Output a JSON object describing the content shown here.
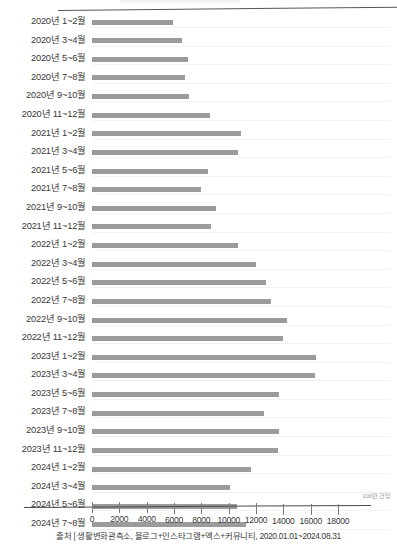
{
  "chart_data": {
    "type": "bar",
    "orientation": "horizontal",
    "title": "",
    "xlabel": "",
    "ylabel": "",
    "unit_label": "100만 건당",
    "xlim": [
      0,
      18000
    ],
    "grid": true,
    "legend": null,
    "bar_color": "#9b9b9b",
    "axis_ticks": [
      0,
      2000,
      4000,
      6000,
      8000,
      10000,
      12000,
      14000,
      16000,
      18000
    ],
    "tick_labels": [
      "0",
      "2000",
      "4000",
      "6000",
      "8000",
      "10000",
      "12000",
      "14000",
      "16000",
      "18000"
    ],
    "categories": [
      "2020년 1~2월",
      "2020년 3~4월",
      "2020년 5~6월",
      "2020년 7~8월",
      "2020년 9~10월",
      "2020년 11~12월",
      "2021년 1~2월",
      "2021년 3~4월",
      "2021년 5~6월",
      "2021년 7~8월",
      "2021년 9~10월",
      "2021년 11~12월",
      "2022년 1~2월",
      "2022년 3~4월",
      "2022년 5~6월",
      "2022년 7~8월",
      "2022년 9~10월",
      "2022년 11~12월",
      "2023년 1~2월",
      "2023년 3~4월",
      "2023년 5~6월",
      "2023년 7~8월",
      "2023년 9~10월",
      "2023년 11~12월",
      "2024년 1~2월",
      "2024년 3~4월",
      "2024년 5~6월",
      "2024년 7~8월"
    ],
    "values": [
      5900,
      6600,
      7000,
      6800,
      7100,
      8600,
      10900,
      10700,
      8500,
      8000,
      9100,
      8700,
      10700,
      12000,
      12700,
      13100,
      14300,
      14000,
      16400,
      16300,
      13700,
      12600,
      13700,
      13600,
      11600,
      10100,
      10600,
      11300
    ]
  },
  "footer": {
    "source": "출처 | 생활변화관측소, 블로그+인스타그램+엑스+커뮤니티, 2020.01.01~2024.08.31"
  }
}
